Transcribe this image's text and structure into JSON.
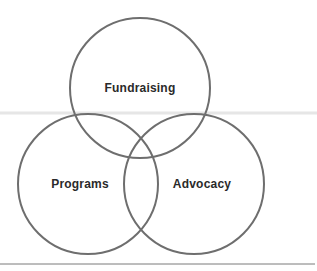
{
  "diagram": {
    "type": "venn",
    "sets": [
      {
        "id": "fundraising",
        "label": "Fundraising",
        "cx": 140,
        "cy": 88,
        "r": 70
      },
      {
        "id": "programs",
        "label": "Programs",
        "cx": 88,
        "cy": 184,
        "r": 70
      },
      {
        "id": "advocacy",
        "label": "Advocacy",
        "cx": 194,
        "cy": 184,
        "r": 70
      }
    ],
    "colors": {
      "stroke": "#6e6e6e",
      "text": "#2a2a2a",
      "divider": "#e4e4e4",
      "rule": "#7a7a7a"
    }
  }
}
